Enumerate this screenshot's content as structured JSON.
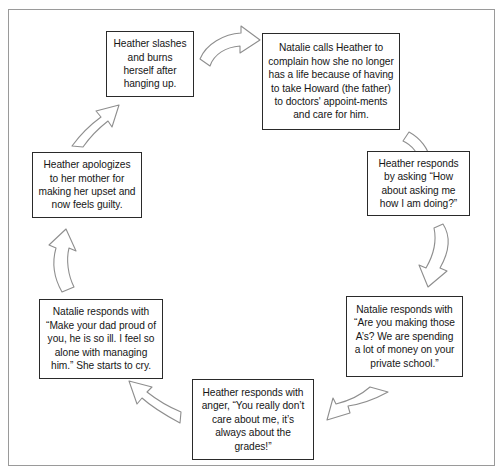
{
  "diagram": {
    "type": "cycle-flowchart",
    "title": "",
    "frame": {
      "border_color": "#9a9a9a"
    },
    "node_border_color": "#2a2a2a",
    "arrow_stroke_color": "#8e8e8e",
    "nodes": [
      {
        "id": "node-1",
        "order": 7,
        "text": "Heather slashes and burns herself after hanging up.",
        "actor": "Heather"
      },
      {
        "id": "node-2",
        "order": 1,
        "text": "Natalie calls Heather to complain how she no longer has a life because of having to take Howard (the father) to doctors' appoint-ments and care for him.",
        "actor": "Natalie"
      },
      {
        "id": "node-3",
        "order": 2,
        "text": "Heather responds by asking “How about asking me how I am doing?”",
        "actor": "Heather"
      },
      {
        "id": "node-4",
        "order": 3,
        "text": "Natalie responds with “Are you making those A’s? We are spending a lot of money on your private school.”",
        "actor": "Natalie"
      },
      {
        "id": "node-5",
        "order": 4,
        "text": "Heather responds with anger, “You really don’t care about me, it’s always about the grades!”",
        "actor": "Heather"
      },
      {
        "id": "node-6",
        "order": 5,
        "text": "Natalie responds with “Make your dad proud of you, he is so ill. I feel so alone with managing him.” She starts to cry.",
        "actor": "Natalie"
      },
      {
        "id": "node-7",
        "order": 6,
        "text": "Heather apologizes to her mother for making her upset and now feels guilty.",
        "actor": "Heather"
      }
    ],
    "arrows": [
      {
        "id": "arrow-1",
        "from": "node-1",
        "to": "node-2",
        "direction": "right",
        "icon": "curved-block-arrow-right-icon"
      },
      {
        "id": "arrow-2",
        "from": "node-2",
        "to": "node-3",
        "direction": "down-right",
        "icon": "curved-block-arrow-down-icon"
      },
      {
        "id": "arrow-3",
        "from": "node-3",
        "to": "node-4",
        "direction": "down",
        "icon": "curved-block-arrow-down-icon"
      },
      {
        "id": "arrow-4",
        "from": "node-4",
        "to": "node-5",
        "direction": "down-left",
        "icon": "curved-block-arrow-left-icon"
      },
      {
        "id": "arrow-5",
        "from": "node-5",
        "to": "node-6",
        "direction": "up-left",
        "icon": "curved-block-arrow-left-icon"
      },
      {
        "id": "arrow-6",
        "from": "node-6",
        "to": "node-7",
        "direction": "up",
        "icon": "curved-block-arrow-up-icon"
      },
      {
        "id": "arrow-7",
        "from": "node-7",
        "to": "node-1",
        "direction": "up-right",
        "icon": "curved-block-arrow-up-icon"
      }
    ]
  }
}
